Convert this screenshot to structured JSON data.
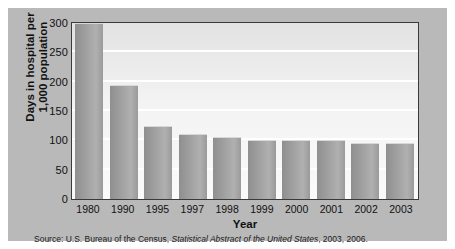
{
  "figure": {
    "source_prefix": "Source: U.S. Bureau of the Census,",
    "source_italic": "Statistical Abstract of the United States",
    "source_suffix": ", 2003, 2006."
  },
  "chart_data": {
    "type": "bar",
    "title": "",
    "xlabel": "Year",
    "ylabel": "Days in hospital per 1,000 population",
    "ylabel_line1": "Days in hospital per",
    "ylabel_line2": "1,000 population",
    "categories": [
      "1980",
      "1990",
      "1995",
      "1997",
      "1998",
      "1999",
      "2000",
      "2001",
      "2002",
      "2003"
    ],
    "values": [
      300,
      195,
      125,
      110,
      105,
      100,
      100,
      100,
      95,
      95
    ],
    "ylim": [
      0,
      300
    ],
    "yticks": [
      0,
      50,
      100,
      150,
      200,
      250,
      300
    ],
    "ytick_labels": [
      "0",
      "50",
      "100",
      "150",
      "200",
      "250",
      "300"
    ],
    "grid": true,
    "legend": "none",
    "bar_color": "#9e9e9e",
    "plot_background": "#efefef",
    "panel_background": "#b9b9b9"
  }
}
